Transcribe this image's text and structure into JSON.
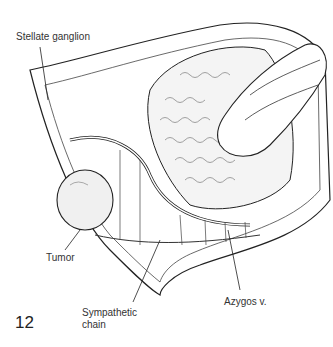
{
  "figure": {
    "number": "12",
    "labels": {
      "stellate_ganglion": "Stellate ganglion",
      "tumor": "Tumor",
      "sympathetic_chain_line1": "Sympathetic",
      "sympathetic_chain_line2": "chain",
      "azygos": "Azygos v."
    }
  }
}
